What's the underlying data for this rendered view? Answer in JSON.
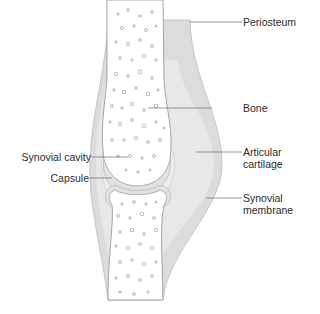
{
  "diagram": {
    "colors": {
      "background": "#ffffff",
      "capsule": "#d9d9d9",
      "capsule_inner": "#e9e9e9",
      "cavity": "#efefef",
      "bone_fill": "#ffffff",
      "bone_outline": "#9a9a9a",
      "trabeculae": "#a8a8a8",
      "leader_line": "#6a6a6a",
      "label_text": "#2b2b2b"
    },
    "labels": {
      "periosteum": "Periosteum",
      "bone": "Bone",
      "articular_cartilage_line1": "Articular",
      "articular_cartilage_line2": "cartilage",
      "synovial_membrane_line1": "Synovial",
      "synovial_membrane_line2": "membrane",
      "synovial_cavity": "Synovial cavity",
      "capsule": "Capsule"
    }
  }
}
